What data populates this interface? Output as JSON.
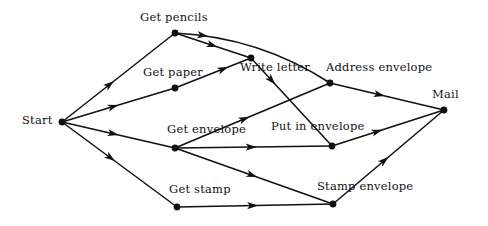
{
  "diagram": {
    "type": "activity-network",
    "background_color": "#ffffff",
    "edge_color": "#101010",
    "node_color": "#101010",
    "text_color": "#121212",
    "width": 488,
    "height": 226,
    "nodes": [
      {
        "id": "start",
        "label": "Start",
        "x": 62,
        "y": 122,
        "label_x": 22,
        "label_y": 115,
        "label_align": "left"
      },
      {
        "id": "get-pencils",
        "label": "Get pencils",
        "x": 175,
        "y": 33,
        "label_x": 140,
        "label_y": 12,
        "label_align": "left"
      },
      {
        "id": "get-paper",
        "label": "Get paper",
        "x": 175,
        "y": 88,
        "label_x": 143,
        "label_y": 67,
        "label_align": "left"
      },
      {
        "id": "write-letter",
        "label": "Write letter",
        "x": 251,
        "y": 58,
        "label_x": 240,
        "label_y": 62,
        "label_align": "left"
      },
      {
        "id": "address-envelope",
        "label": "Address  envelope",
        "x": 330,
        "y": 83,
        "label_x": 326,
        "label_y": 62,
        "label_align": "left"
      },
      {
        "id": "get-envelope",
        "label": "Get envelope",
        "x": 175,
        "y": 148,
        "label_x": 167,
        "label_y": 124,
        "label_align": "left"
      },
      {
        "id": "put-in-envelope",
        "label": "Put in envelope",
        "x": 332,
        "y": 146,
        "label_x": 271,
        "label_y": 121,
        "label_align": "left"
      },
      {
        "id": "get-stamp",
        "label": "Get stamp",
        "x": 177,
        "y": 207,
        "label_x": 169,
        "label_y": 184,
        "label_align": "left"
      },
      {
        "id": "stamp-envelope",
        "label": "Stamp envelope",
        "x": 333,
        "y": 204,
        "label_x": 317,
        "label_y": 181,
        "label_align": "left"
      },
      {
        "id": "mail",
        "label": "Mail",
        "x": 444,
        "y": 110,
        "label_x": 432,
        "label_y": 89,
        "label_align": "left"
      }
    ],
    "edges": [
      {
        "id": "start-get-pencils",
        "from": "start",
        "to": "get-pencils",
        "curved": false,
        "arrow_t": 0.46
      },
      {
        "id": "start-get-paper",
        "from": "start",
        "to": "get-paper",
        "curved": false,
        "arrow_t": 0.5
      },
      {
        "id": "start-get-envelope",
        "from": "start",
        "to": "get-envelope",
        "curved": false,
        "arrow_t": 0.5
      },
      {
        "id": "start-get-stamp",
        "from": "start",
        "to": "get-stamp",
        "curved": false,
        "arrow_t": 0.46
      },
      {
        "id": "get-pencils-write-letter",
        "from": "get-pencils",
        "to": "write-letter",
        "curved": false,
        "arrow_t": 0.56
      },
      {
        "id": "get-pencils-address-envelope",
        "from": "get-pencils",
        "to": "address-envelope",
        "curved": true,
        "bow": 22,
        "arrow_t": 0.2
      },
      {
        "id": "get-paper-write-letter",
        "from": "get-paper",
        "to": "write-letter",
        "curved": false,
        "arrow_t": 0.7
      },
      {
        "id": "write-letter-put-in-envelope",
        "from": "write-letter",
        "to": "put-in-envelope",
        "curved": false,
        "arrow_t": 0.3
      },
      {
        "id": "get-envelope-address-envelope",
        "from": "get-envelope",
        "to": "address-envelope",
        "curved": false,
        "arrow_t": 0.48
      },
      {
        "id": "get-envelope-put-in-envelope",
        "from": "get-envelope",
        "to": "put-in-envelope",
        "curved": false,
        "arrow_t": 0.52
      },
      {
        "id": "get-envelope-stamp-envelope",
        "from": "get-envelope",
        "to": "stamp-envelope",
        "curved": false,
        "arrow_t": 0.52
      },
      {
        "id": "get-stamp-stamp-envelope",
        "from": "get-stamp",
        "to": "stamp-envelope",
        "curved": false,
        "arrow_t": 0.52
      },
      {
        "id": "address-envelope-mail",
        "from": "address-envelope",
        "to": "mail",
        "curved": false,
        "arrow_t": 0.48
      },
      {
        "id": "put-in-envelope-mail",
        "from": "put-in-envelope",
        "to": "mail",
        "curved": false,
        "arrow_t": 0.45
      },
      {
        "id": "stamp-envelope-mail",
        "from": "stamp-envelope",
        "to": "mail",
        "curved": false,
        "arrow_t": 0.5
      }
    ]
  }
}
